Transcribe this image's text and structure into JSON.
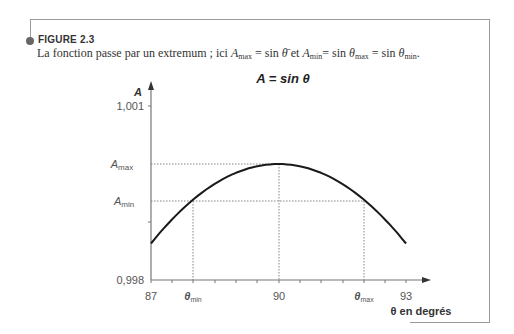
{
  "figure": {
    "label": "FIGURE 2.3",
    "caption_prefix": "La fonction passe par un extremum ; ici ",
    "caption_parts": {
      "amax": "A",
      "amax_sub": "max",
      "eq1": " = sin ",
      "theta_bar": "θ̄",
      "et": "  et ",
      "amin": "A",
      "amin_sub": "min",
      "eq2": "= sin ",
      "theta1": "θ",
      "theta1_sub": "max",
      "eq3": " = sin ",
      "theta2": "θ",
      "theta2_sub": "min",
      "end": "."
    }
  },
  "chart": {
    "title": "A = sin θ",
    "ylabel": "A",
    "xlabel": "θ en degrés",
    "yticks": [
      "1,001",
      "0,998"
    ],
    "ymarks": {
      "amax": "A",
      "amax_sub": "max",
      "amin": "A",
      "amin_sub": "min"
    },
    "xticks": [
      "87",
      "90",
      "93"
    ],
    "xmarks": {
      "theta_min": "θ",
      "theta_min_sub": "min",
      "theta_max": "θ",
      "theta_max_sub": "max"
    }
  },
  "chart_data": {
    "type": "line",
    "title": "A = sin θ",
    "xlabel": "θ en degrés",
    "ylabel": "A",
    "xlim": [
      87,
      93
    ],
    "ylim": [
      0.998,
      1.001
    ],
    "x_ticks": [
      87,
      90,
      93
    ],
    "x_minor_tick_step": 0.5,
    "y_ticks": [
      0.998,
      0.999,
      1.001
    ],
    "series": [
      {
        "name": "sin θ",
        "x": [
          87.0,
          87.5,
          88.0,
          88.5,
          89.0,
          89.5,
          90.0,
          90.5,
          91.0,
          91.5,
          92.0,
          92.5,
          93.0
        ],
        "y": [
          0.99863,
          0.99905,
          0.99939,
          0.99966,
          0.99985,
          0.99996,
          1.0,
          0.99996,
          0.99985,
          0.99966,
          0.99939,
          0.99905,
          0.99863
        ]
      }
    ],
    "annotations": [
      {
        "label": "A_max",
        "y": 1.0,
        "x": 90
      },
      {
        "label": "A_min",
        "y": 0.99939,
        "x_left": 88.0,
        "x_right": 92.0
      },
      {
        "label": "θ_min",
        "x": 88.0
      },
      {
        "label": "θ_max",
        "x": 92.0
      }
    ],
    "grid": false,
    "legend": "none"
  }
}
